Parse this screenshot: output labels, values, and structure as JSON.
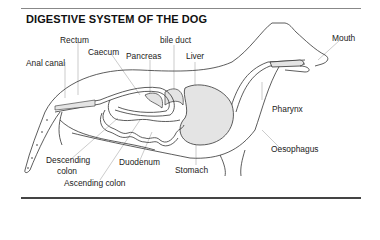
{
  "title": "DIGESTIVE SYSTEM OF THE DOG",
  "labels": {
    "rectum": "Rectum",
    "caecum": "Caecum",
    "pancreas": "Pancreas",
    "bile_duct": "bile duct",
    "liver": "Liver",
    "mouth": "Mouth",
    "anal_canal": "Anal canal",
    "pharynx": "Pharynx",
    "oesophagus": "Oesophagus",
    "descending_colon_1": "Descending",
    "descending_colon_2": "colon",
    "duodenum": "Duodenum",
    "stomach": "Stomach",
    "ascending_colon": "Ascending colon"
  },
  "colors": {
    "outline": "#333333",
    "organ_fill": "#e4e4e4",
    "leader": "#aaaaaa"
  }
}
